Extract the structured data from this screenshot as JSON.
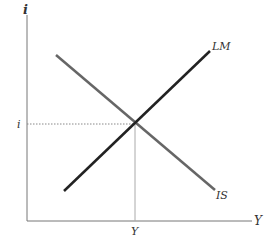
{
  "diagram": {
    "y_axis_label": "i",
    "x_axis_label": "Y",
    "equilibrium_i_label": "i",
    "equilibrium_Y_label": "Y",
    "curves": [
      {
        "name": "LM",
        "label": "LM",
        "color": "#222222"
      },
      {
        "name": "IS",
        "label": "IS",
        "color": "#666666"
      }
    ]
  }
}
